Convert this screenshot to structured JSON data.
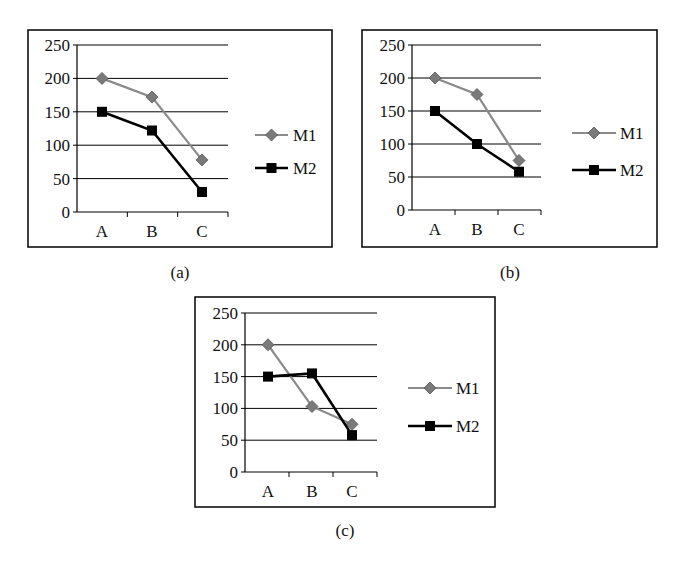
{
  "figure": {
    "captions": [
      "(a)",
      "(b)",
      "(c)"
    ]
  },
  "colors": {
    "M1": "#8a8a8a",
    "M1_marker": "#7a7a7a",
    "M2": "#000000",
    "grid": "#000000",
    "frame": "#000000",
    "background": "#ffffff"
  },
  "chart_data": [
    {
      "type": "line",
      "title": "",
      "caption": "(a)",
      "xlabel": "",
      "ylabel": "",
      "categories": [
        "A",
        "B",
        "C"
      ],
      "series": [
        {
          "name": "M1",
          "marker": "diamond",
          "values": [
            200,
            172,
            78
          ]
        },
        {
          "name": "M2",
          "marker": "square",
          "values": [
            150,
            122,
            30
          ]
        }
      ],
      "yticks": [
        0,
        50,
        100,
        150,
        200,
        250
      ],
      "ylim": [
        0,
        250
      ],
      "grid": true,
      "legend_position": "right",
      "layout": {
        "frame": [
          28,
          30,
          332,
          247
        ],
        "axis_x": 77,
        "plot_right": 228,
        "y0": 212,
        "y250": 45,
        "cat_x": [
          102,
          152,
          202
        ],
        "legend_x1": 255,
        "legend_x2": 288,
        "legend_text_x": 293,
        "legend_y": [
          135,
          168
        ],
        "caption_xy": [
          180,
          278
        ]
      }
    },
    {
      "type": "line",
      "title": "",
      "caption": "(b)",
      "xlabel": "",
      "ylabel": "",
      "categories": [
        "A",
        "B",
        "C"
      ],
      "series": [
        {
          "name": "M1",
          "marker": "diamond",
          "values": [
            200,
            175,
            75
          ]
        },
        {
          "name": "M2",
          "marker": "square",
          "values": [
            150,
            100,
            58
          ]
        }
      ],
      "yticks": [
        0,
        50,
        100,
        150,
        200,
        250
      ],
      "ylim": [
        0,
        250
      ],
      "grid": true,
      "legend_position": "right",
      "layout": {
        "frame": [
          362,
          30,
          657,
          247
        ],
        "axis_x": 412,
        "plot_right": 541,
        "y0": 210,
        "y250": 45,
        "cat_x": [
          435,
          477,
          519
        ],
        "legend_x1": 572,
        "legend_x2": 616,
        "legend_text_x": 620,
        "legend_y": [
          133,
          170
        ],
        "caption_xy": [
          510,
          278
        ]
      }
    },
    {
      "type": "line",
      "title": "",
      "caption": "(c)",
      "xlabel": "",
      "ylabel": "",
      "categories": [
        "A",
        "B",
        "C"
      ],
      "series": [
        {
          "name": "M1",
          "marker": "diamond",
          "values": [
            200,
            103,
            75
          ]
        },
        {
          "name": "M2",
          "marker": "square",
          "values": [
            150,
            155,
            58
          ]
        }
      ],
      "yticks": [
        0,
        50,
        100,
        150,
        200,
        250
      ],
      "ylim": [
        0,
        250
      ],
      "grid": true,
      "legend_position": "right",
      "layout": {
        "frame": [
          195,
          297,
          495,
          507
        ],
        "axis_x": 245,
        "plot_right": 377,
        "y0": 472,
        "y250": 313,
        "cat_x": [
          268,
          312,
          352
        ],
        "legend_x1": 408,
        "legend_x2": 452,
        "legend_text_x": 456,
        "legend_y": [
          388,
          426
        ],
        "caption_xy": [
          345,
          536
        ]
      }
    }
  ]
}
